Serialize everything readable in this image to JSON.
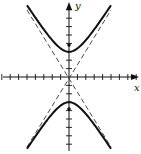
{
  "figure": {
    "type": "hyperbola",
    "orientation": "vertical",
    "axes": {
      "x_label": "x",
      "y_label": "y",
      "x_ticks_each_side": 8,
      "y_ticks_each_side": 8
    },
    "curve": {
      "equation_form": "y^2/a^2 - x^2/b^2 = 1",
      "vertex_units": 3,
      "focus_units": 3.7,
      "asymptote_slope": 1.6
    },
    "colors": {
      "curve": "#111111",
      "axes": "#111111",
      "asymptote": "#333333",
      "background": "#ffffff"
    }
  }
}
